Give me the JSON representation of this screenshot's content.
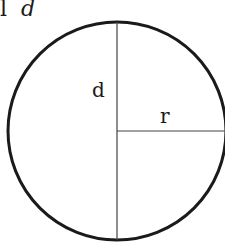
{
  "title": {
    "prefix": "l",
    "variable": "d"
  },
  "diagram": {
    "shape": "circle",
    "diameter_label": "d",
    "radius_label": "r",
    "stroke_color": "#1a1a1a"
  }
}
